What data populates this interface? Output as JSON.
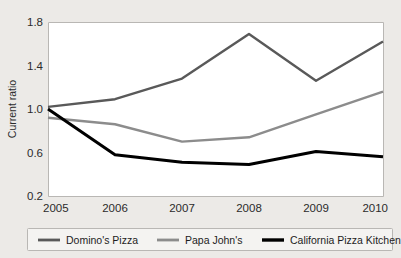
{
  "chart_data": {
    "type": "line",
    "title": "",
    "xlabel": "",
    "ylabel": "Current ratio",
    "x": [
      2005,
      2006,
      2007,
      2008,
      2009,
      2010
    ],
    "xtick_labels": [
      "2005",
      "2006",
      "2007",
      "2008",
      "2009",
      "2010"
    ],
    "ytick_labels": [
      "0.2",
      "0.6",
      "1.0",
      "1.4",
      "1.8"
    ],
    "yticks": [
      0.2,
      0.6,
      1.0,
      1.4,
      1.8
    ],
    "ylim": [
      0.2,
      1.8
    ],
    "xlim": [
      2005,
      2010
    ],
    "grid": false,
    "legend_position": "bottom",
    "series": [
      {
        "name": "Domino's Pizza",
        "color": "#595959",
        "width": 2.4,
        "values": [
          1.02,
          1.09,
          1.28,
          1.69,
          1.26,
          1.62
        ]
      },
      {
        "name": "Papa John's",
        "color": "#8c8c8c",
        "width": 2.4,
        "values": [
          0.92,
          0.86,
          0.7,
          0.74,
          0.95,
          1.16
        ]
      },
      {
        "name": "California Pizza Kitchen",
        "color": "#000000",
        "width": 3.0,
        "values": [
          1.0,
          0.58,
          0.51,
          0.49,
          0.61,
          0.56
        ]
      }
    ]
  },
  "legend": {
    "entries": [
      {
        "label": "Domino's Pizza"
      },
      {
        "label": "Papa John's"
      },
      {
        "label": "California Pizza Kitchen"
      }
    ]
  },
  "axes": {
    "y_title": "Current ratio"
  },
  "colors": {
    "figure_background": "#eceae7",
    "plot_background": "#ffffff",
    "axis_line": "#b9b7b4",
    "text": "#2b2b2b"
  }
}
